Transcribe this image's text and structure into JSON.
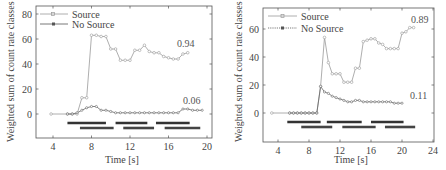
{
  "chart_data": [
    {
      "type": "line",
      "title": "",
      "xlabel": "Time [s]",
      "ylabel": "Weighted sum of count rate classes",
      "xlim": [
        2,
        20
      ],
      "ylim": [
        -20,
        85
      ],
      "xticks": [
        4,
        8,
        12,
        16,
        20
      ],
      "yticks": [
        0,
        20,
        40,
        60,
        80
      ],
      "grid": false,
      "legend": {
        "position": "upper left",
        "entries": [
          "Source",
          "No Source"
        ]
      },
      "series": [
        {
          "name": "Source",
          "color": "#999999",
          "x": [
            3.8,
            5.5,
            6.0,
            6.5,
            7.0,
            7.5,
            8.0,
            8.5,
            9.0,
            9.5,
            10.0,
            10.5,
            11.0,
            11.5,
            12.0,
            12.5,
            13.0,
            13.5,
            14.0,
            14.5,
            15.0,
            15.5,
            16.0,
            16.5,
            17.0,
            17.5,
            18.0
          ],
          "y": [
            0,
            0,
            0,
            0,
            13,
            13,
            63,
            63,
            62,
            62,
            52,
            52,
            43,
            43,
            43,
            51,
            51,
            55,
            50,
            49,
            49,
            46,
            45,
            44,
            44,
            48,
            49
          ]
        },
        {
          "name": "No Source",
          "color": "#666666",
          "x": [
            5.5,
            6.0,
            6.5,
            7.0,
            7.5,
            8.0,
            8.5,
            9.0,
            9.5,
            10.0,
            10.5,
            11.0,
            11.5,
            12.0,
            12.5,
            13.0,
            13.5,
            14.0,
            14.5,
            15.0,
            15.5,
            16.0,
            16.5,
            17.0,
            17.5,
            18.0,
            18.5,
            19.0,
            19.5
          ],
          "y": [
            0,
            0,
            1,
            3,
            5,
            6,
            6,
            3,
            3,
            2,
            1,
            1,
            1,
            1,
            1,
            1,
            1,
            1,
            1,
            1,
            1,
            1,
            1,
            1,
            4,
            4,
            3,
            3,
            3
          ]
        }
      ],
      "annotations": [
        {
          "text": "0.94",
          "x": 18.3,
          "y": 56
        },
        {
          "text": "0.06",
          "x": 18.3,
          "y": 10
        }
      ],
      "segments": [
        {
          "row": 1,
          "ranges": [
            [
              5.5,
              9.5
            ],
            [
              10.5,
              13.8
            ],
            [
              14.7,
              18.2
            ]
          ]
        },
        {
          "row": 2,
          "ranges": [
            [
              6.8,
              10.3
            ],
            [
              11.3,
              14.5
            ],
            [
              15.6,
              19.3
            ]
          ]
        }
      ]
    },
    {
      "type": "line",
      "title": "",
      "xlabel": "Time [s]",
      "ylabel": "Weighted sum of count rate classes",
      "xlim": [
        2,
        24
      ],
      "ylim": [
        -20,
        75
      ],
      "xticks": [
        4,
        8,
        12,
        16,
        20,
        24
      ],
      "yticks": [
        0,
        20,
        40,
        60
      ],
      "grid": false,
      "legend": {
        "position": "upper left",
        "entries": [
          "Source",
          "No Source"
        ]
      },
      "series": [
        {
          "name": "Source",
          "color": "#999999",
          "x": [
            3.2,
            5.5,
            6.0,
            6.5,
            7.0,
            7.5,
            8.0,
            8.5,
            9.0,
            9.5,
            10.0,
            10.5,
            11.0,
            11.5,
            12.0,
            12.5,
            13.0,
            13.5,
            14.0,
            14.5,
            15.0,
            15.5,
            16.0,
            16.5,
            17.0,
            17.5,
            18.0,
            18.5,
            19.0,
            19.5,
            20.0,
            20.5,
            21.0,
            21.5
          ],
          "y": [
            0,
            0,
            0,
            0,
            0,
            0,
            0,
            0,
            0,
            19,
            54,
            36,
            28,
            28,
            28,
            22,
            22,
            22,
            32,
            32,
            51,
            52,
            53,
            53,
            50,
            49,
            46,
            46,
            46,
            46,
            57,
            58,
            61,
            61
          ]
        },
        {
          "name": "No Source",
          "color": "#666666",
          "x": [
            5.5,
            6.0,
            6.5,
            7.0,
            7.5,
            8.0,
            8.5,
            9.0,
            9.5,
            10.0,
            10.5,
            11.0,
            11.5,
            12.0,
            12.5,
            13.0,
            13.5,
            14.0,
            14.5,
            15.0,
            15.5,
            16.0,
            16.5,
            17.0,
            17.5,
            18.0,
            18.5,
            19.0,
            19.5,
            20.0
          ],
          "y": [
            0,
            0,
            0,
            0,
            0,
            0,
            0,
            0,
            19,
            15,
            14,
            12,
            11,
            10,
            9,
            8,
            8,
            9,
            9,
            8,
            8,
            8,
            8,
            8,
            8,
            8,
            8,
            7,
            7,
            7
          ]
        }
      ],
      "annotations": [
        {
          "text": "0.89",
          "x": 20.6,
          "y": 66
        },
        {
          "text": "0.11",
          "x": 20.8,
          "y": 12
        }
      ],
      "segments": [
        {
          "row": 1,
          "ranges": [
            [
              5.2,
              9.5
            ],
            [
              10.3,
              14.8
            ],
            [
              16.0,
              20.2
            ]
          ]
        },
        {
          "row": 2,
          "ranges": [
            [
              7.0,
              11.0
            ],
            [
              12.3,
              16.6
            ],
            [
              17.8,
              21.7
            ]
          ]
        }
      ]
    }
  ],
  "charts": [
    {
      "xlabel": "Time [s]",
      "ylabel": "Weighted sum of count rate classes",
      "legend_source": "Source",
      "legend_nosource": "No Source",
      "ann_source": "0.94",
      "ann_nosource": "0.06"
    },
    {
      "xlabel": "Time [s]",
      "ylabel": "Weighted sum of count rate classes",
      "legend_source": "Source",
      "legend_nosource": "No Source",
      "ann_source": "0.89",
      "ann_nosource": "0.11"
    }
  ]
}
